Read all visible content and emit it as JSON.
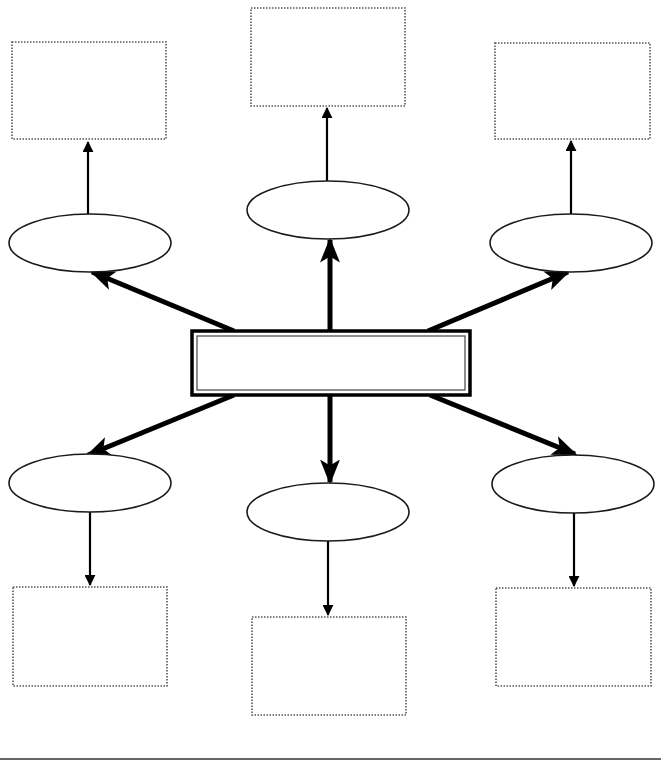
{
  "diagram": {
    "type": "spider-map graphic organizer",
    "colors": {
      "stroke": "#000000",
      "dotted_stroke": "#555555",
      "background": "#ffffff"
    },
    "center": {
      "label": "",
      "x": 192,
      "y": 331,
      "w": 278,
      "h": 64
    },
    "branches": [
      {
        "id": "top-left",
        "ellipse": {
          "cx": 90,
          "cy": 243,
          "rx": 81,
          "ry": 29,
          "label": ""
        },
        "box": {
          "x": 12,
          "y": 42,
          "w": 154,
          "h": 97,
          "label": ""
        }
      },
      {
        "id": "top-center",
        "ellipse": {
          "cx": 328,
          "cy": 210,
          "rx": 81,
          "ry": 29,
          "label": ""
        },
        "box": {
          "x": 251,
          "y": 8,
          "w": 154,
          "h": 98,
          "label": ""
        }
      },
      {
        "id": "top-right",
        "ellipse": {
          "cx": 571,
          "cy": 243,
          "rx": 81,
          "ry": 29,
          "label": ""
        },
        "box": {
          "x": 495,
          "y": 43,
          "w": 155,
          "h": 96,
          "label": ""
        }
      },
      {
        "id": "bottom-left",
        "ellipse": {
          "cx": 90,
          "cy": 483,
          "rx": 81,
          "ry": 29,
          "label": ""
        },
        "box": {
          "x": 13,
          "y": 587,
          "w": 154,
          "h": 99,
          "label": ""
        }
      },
      {
        "id": "bottom-center",
        "ellipse": {
          "cx": 328,
          "cy": 512,
          "rx": 81,
          "ry": 29,
          "label": ""
        },
        "box": {
          "x": 252,
          "y": 617,
          "w": 154,
          "h": 98,
          "label": ""
        }
      },
      {
        "id": "bottom-right",
        "ellipse": {
          "cx": 573,
          "cy": 484,
          "rx": 81,
          "ry": 29,
          "label": ""
        },
        "box": {
          "x": 496,
          "y": 588,
          "w": 155,
          "h": 98,
          "label": ""
        }
      }
    ],
    "thick_arrows": [
      {
        "from": [
          234,
          331
        ],
        "to": [
          92,
          272
        ]
      },
      {
        "from": [
          330,
          331
        ],
        "to": [
          330,
          240
        ]
      },
      {
        "from": [
          428,
          331
        ],
        "to": [
          568,
          272
        ]
      },
      {
        "from": [
          234,
          395
        ],
        "to": [
          88,
          455
        ]
      },
      {
        "from": [
          330,
          395
        ],
        "to": [
          330,
          482
        ]
      },
      {
        "from": [
          430,
          395
        ],
        "to": [
          575,
          454
        ]
      }
    ],
    "thin_arrows": [
      {
        "from": [
          88,
          214
        ],
        "to": [
          88,
          142
        ]
      },
      {
        "from": [
          327,
          181
        ],
        "to": [
          327,
          108
        ]
      },
      {
        "from": [
          571,
          214
        ],
        "to": [
          571,
          141
        ]
      },
      {
        "from": [
          90,
          512
        ],
        "to": [
          90,
          585
        ]
      },
      {
        "from": [
          328,
          541
        ],
        "to": [
          328,
          615
        ]
      },
      {
        "from": [
          574,
          513
        ],
        "to": [
          574,
          586
        ]
      }
    ],
    "baseline": {
      "x1": 0,
      "x2": 661,
      "y": 759
    }
  }
}
